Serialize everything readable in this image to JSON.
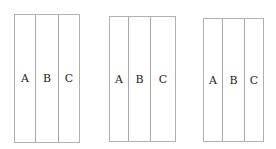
{
  "diagram": {
    "panels": [
      {
        "columns": [
          {
            "label": "A"
          },
          {
            "label": "B"
          },
          {
            "label": "C"
          }
        ]
      },
      {
        "columns": [
          {
            "label": "A"
          },
          {
            "label": "B"
          },
          {
            "label": "C"
          }
        ]
      },
      {
        "columns": [
          {
            "label": "A"
          },
          {
            "label": "B"
          },
          {
            "label": "C"
          }
        ]
      }
    ],
    "colors": {
      "border": "#b0b0b0",
      "text": "#222222",
      "background": "#ffffff"
    }
  }
}
